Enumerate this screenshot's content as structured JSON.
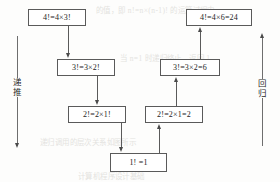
{
  "diagram": {
    "left_axis": {
      "label": "递推",
      "direction": "down"
    },
    "right_axis": {
      "label": "回归",
      "direction": "up"
    },
    "nodes": {
      "left_l1": "4!=4×3!",
      "left_l2": "3!=3×2!",
      "left_l3": "2!=2×1!",
      "base": "1! =1",
      "right_l3": "2!=2×1=2",
      "right_l2": "3!=3×2=6",
      "right_l1": "4!=4×6=24"
    }
  },
  "bleed_text": {
    "b1": "的值，即 n!=n×(n-1)! 的运算过程中",
    "b2": "当 n=1 时递归终止，返回 1",
    "b3": "递归调用的层次关系如图所示",
    "b4": "计算机程序设计基础"
  }
}
